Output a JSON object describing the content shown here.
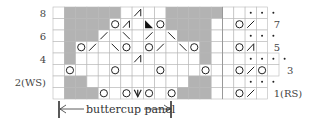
{
  "title": "",
  "legend_panel": {
    "label": "buttercup panel"
  },
  "row_labels_left": [
    {
      "text": "8",
      "row": 8
    },
    {
      "text": "6",
      "row": 6
    },
    {
      "text": "4",
      "row": 4
    },
    {
      "text": "2(WS)",
      "row": 2
    }
  ],
  "row_labels_right": [
    {
      "text": "7",
      "row": 7
    },
    {
      "text": "5",
      "row": 5
    },
    {
      "text": "3",
      "row": 3
    },
    {
      "text": "1(RS)",
      "row": 1
    }
  ],
  "grid": {
    "columns": 20,
    "rows": 8,
    "colors": {
      "shaded": "#b3b3b3",
      "line": "#b8b8b8",
      "background": "#ffffff"
    },
    "row_widths": {
      "1": 19,
      "2": 19,
      "3": 20,
      "4": 20,
      "5": 19,
      "6": 19,
      "7": 19,
      "8": 19
    },
    "shaded": {
      "8": [
        1,
        2,
        3,
        4,
        5,
        10,
        11,
        12,
        13,
        14
      ],
      "7": [
        1,
        2,
        3,
        4,
        10,
        11,
        12,
        13
      ],
      "6": [
        1,
        2,
        3,
        11,
        12,
        13
      ],
      "5": [
        1,
        13
      ],
      "4": [
        1,
        13
      ],
      "3": [],
      "2": [
        1,
        2,
        12,
        13
      ],
      "1": [
        1,
        2,
        3,
        11,
        12,
        13
      ]
    },
    "symbols": {
      "8": [
        {
          "col": 7,
          "sym": "k3tog"
        },
        {
          "col": 17,
          "sym": "purl"
        },
        {
          "col": 18,
          "sym": "purl"
        },
        {
          "col": 19,
          "sym": "purl"
        }
      ],
      "7": [
        {
          "col": 5,
          "sym": "yo"
        },
        {
          "col": 6,
          "sym": "k3tog"
        },
        {
          "col": 8,
          "sym": "no-stitch"
        },
        {
          "col": 9,
          "sym": "yo"
        },
        {
          "col": 16,
          "sym": "yo"
        },
        {
          "col": 17,
          "sym": "k2tog"
        }
      ],
      "6": [
        {
          "col": 4,
          "sym": "k2tog"
        },
        {
          "col": 6,
          "sym": "ssk"
        },
        {
          "col": 8,
          "sym": "k2tog"
        },
        {
          "col": 10,
          "sym": "ssk"
        },
        {
          "col": 17,
          "sym": "purl"
        },
        {
          "col": 18,
          "sym": "purl"
        },
        {
          "col": 19,
          "sym": "purl"
        }
      ],
      "5": [
        {
          "col": 2,
          "sym": "yo"
        },
        {
          "col": 3,
          "sym": "k2tog"
        },
        {
          "col": 5,
          "sym": "ssk"
        },
        {
          "col": 6,
          "sym": "yo"
        },
        {
          "col": 8,
          "sym": "yo"
        },
        {
          "col": 9,
          "sym": "k2tog"
        },
        {
          "col": 11,
          "sym": "ssk"
        },
        {
          "col": 12,
          "sym": "yo"
        },
        {
          "col": 16,
          "sym": "yo"
        },
        {
          "col": 17,
          "sym": "k3tog"
        }
      ],
      "4": [
        {
          "col": 7,
          "sym": "k3tog"
        },
        {
          "col": 17,
          "sym": "purl"
        },
        {
          "col": 18,
          "sym": "purl"
        },
        {
          "col": 19,
          "sym": "purl"
        },
        {
          "col": 20,
          "sym": "purl"
        }
      ],
      "3": [
        {
          "col": 1,
          "sym": "yo"
        },
        {
          "col": 5,
          "sym": "yo"
        },
        {
          "col": 9,
          "sym": "yo"
        },
        {
          "col": 13,
          "sym": "yo"
        },
        {
          "col": 16,
          "sym": "yo"
        },
        {
          "col": 17,
          "sym": "k2tog"
        },
        {
          "col": 18,
          "sym": "yo"
        }
      ],
      "2": [
        {
          "col": 17,
          "sym": "purl"
        },
        {
          "col": 18,
          "sym": "purl"
        },
        {
          "col": 19,
          "sym": "purl"
        }
      ],
      "1": [
        {
          "col": 4,
          "sym": "yo"
        },
        {
          "col": 6,
          "sym": "yo"
        },
        {
          "col": 7,
          "sym": "cdd"
        },
        {
          "col": 8,
          "sym": "yo"
        },
        {
          "col": 10,
          "sym": "yo"
        },
        {
          "col": 16,
          "sym": "yo"
        },
        {
          "col": 17,
          "sym": "k2tog"
        }
      ]
    },
    "symbol_glyphs": {
      "yo": "O",
      "k2tog": "/",
      "ssk": "\\",
      "k3tog": "⋀",
      "cdd": "V",
      "purl": "•",
      "no-stitch": "◣"
    }
  }
}
